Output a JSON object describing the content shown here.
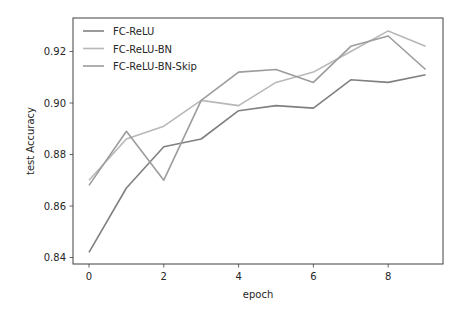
{
  "chart_data": {
    "type": "line",
    "title": "",
    "xlabel": "epoch",
    "ylabel": "test Accuracy",
    "x": [
      0,
      1,
      2,
      3,
      4,
      5,
      6,
      7,
      8,
      9
    ],
    "xlim": [
      -0.43,
      9.43
    ],
    "ylim": [
      0.8385,
      0.9315
    ],
    "xticks": [
      0,
      2,
      4,
      6,
      8
    ],
    "yticks": [
      0.84,
      0.86,
      0.88,
      0.9,
      0.92
    ],
    "xtick_labels": [
      "0",
      "2",
      "4",
      "6",
      "8"
    ],
    "ytick_labels": [
      "0.84",
      "0.86",
      "0.88",
      "0.90",
      "0.92"
    ],
    "grid": false,
    "legend_position": "upper left",
    "series": [
      {
        "name": "FC-ReLU",
        "color": "#808080",
        "values": [
          0.842,
          0.867,
          0.883,
          0.886,
          0.897,
          0.899,
          0.898,
          0.909,
          0.908,
          0.911
        ]
      },
      {
        "name": "FC-ReLU-BN",
        "color": "#b8b8b8",
        "values": [
          0.87,
          0.886,
          0.891,
          0.901,
          0.899,
          0.908,
          0.912,
          0.92,
          0.928,
          0.922
        ]
      },
      {
        "name": "FC-ReLU-BN-Skip",
        "color": "#9c9c9c",
        "values": [
          0.868,
          0.889,
          0.87,
          0.901,
          0.912,
          0.913,
          0.908,
          0.922,
          0.926,
          0.913
        ]
      }
    ]
  },
  "legend": {
    "items": [
      {
        "label": "FC-ReLU"
      },
      {
        "label": "FC-ReLU-BN"
      },
      {
        "label": "FC-ReLU-BN-Skip"
      }
    ]
  },
  "axes": {
    "xlabel": "epoch",
    "ylabel": "test Accuracy"
  }
}
